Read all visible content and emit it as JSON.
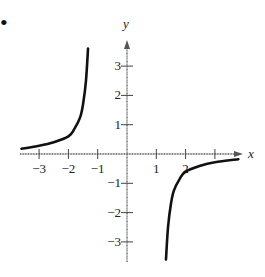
{
  "bullet": "•",
  "chart_data": {
    "type": "line",
    "title": "",
    "xlabel": "x",
    "ylabel": "y",
    "xlim": [
      -3.6,
      3.8
    ],
    "ylim": [
      -3.5,
      3.9
    ],
    "grid": false,
    "x_ticks": [
      -3,
      -2,
      -1,
      1,
      2,
      3
    ],
    "x_tick_labels": [
      "−3",
      "−2",
      "−1",
      "1",
      "2",
      ""
    ],
    "y_ticks": [
      3,
      2,
      1,
      -1,
      -2,
      -3
    ],
    "y_tick_labels": [
      "3",
      "2",
      "1",
      "−1",
      "−2",
      "−3"
    ],
    "series": [
      {
        "name": "left-branch",
        "x": [
          -3.6,
          -3.0,
          -2.5,
          -2.0,
          -1.8,
          -1.6,
          -1.5,
          -1.4,
          -1.33
        ],
        "y": [
          0.18,
          0.28,
          0.4,
          0.6,
          0.85,
          1.25,
          1.7,
          2.5,
          3.6
        ]
      },
      {
        "name": "right-branch",
        "x": [
          1.33,
          1.4,
          1.5,
          1.6,
          1.8,
          2.0,
          2.5,
          3.0,
          3.8
        ],
        "y": [
          -3.6,
          -2.5,
          -1.7,
          -1.25,
          -0.85,
          -0.6,
          -0.4,
          -0.28,
          -0.18
        ]
      }
    ],
    "color": "#111111"
  }
}
